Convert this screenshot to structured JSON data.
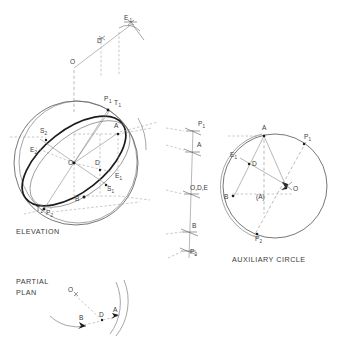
{
  "drawing": {
    "title": "Sphere tangent-plane / auxiliary circle construction",
    "captions": {
      "elevation": "ELEVATION",
      "partial_plan_line1": "PARTIAL",
      "partial_plan_line2": "PLAN",
      "auxiliary_circle": "AUXILIARY CIRCLE"
    }
  },
  "colors": {
    "paper": "#ffffff",
    "outline": "#4a4a4a",
    "heavy": "#1c1c1c",
    "construction": "#7d7d7d",
    "dashed": "#8a8a8a",
    "text": "#3a3a3a"
  },
  "top_view": {
    "points": [
      {
        "id": "top-O",
        "base": "O",
        "sub": "",
        "x": 70,
        "y": 64
      },
      {
        "id": "top-D",
        "base": "D",
        "sub": "",
        "x": 97,
        "y": 43
      },
      {
        "id": "top-E1",
        "base": "E",
        "sub": "1",
        "x": 124,
        "y": 20
      }
    ]
  },
  "elevation": {
    "points": [
      {
        "id": "elev-P1",
        "base": "P",
        "sub": "1",
        "x": 104,
        "y": 101
      },
      {
        "id": "elev-T1",
        "base": "T",
        "sub": "1",
        "x": 114,
        "y": 105
      },
      {
        "id": "elev-A",
        "base": "A",
        "sub": "",
        "x": 114,
        "y": 128
      },
      {
        "id": "elev-S2",
        "base": "S",
        "sub": "2",
        "x": 40,
        "y": 133
      },
      {
        "id": "elev-E2",
        "base": "E",
        "sub": "2",
        "x": 30,
        "y": 152
      },
      {
        "id": "elev-O",
        "base": "O",
        "sub": "",
        "x": 68,
        "y": 165
      },
      {
        "id": "elev-D",
        "base": "D",
        "sub": "",
        "x": 95,
        "y": 165
      },
      {
        "id": "elev-E1",
        "base": "E",
        "sub": "1",
        "x": 115,
        "y": 178
      },
      {
        "id": "elev-S1",
        "base": "S",
        "sub": "1",
        "x": 107,
        "y": 191
      },
      {
        "id": "elev-B",
        "base": "B",
        "sub": "",
        "x": 75,
        "y": 201
      },
      {
        "id": "elev-T2",
        "base": "T",
        "sub": "2",
        "x": 36,
        "y": 211
      },
      {
        "id": "elev-P2",
        "base": "P",
        "sub": "2",
        "x": 46,
        "y": 215
      }
    ]
  },
  "side_line": {
    "points": [
      {
        "id": "side-P1",
        "base": "P",
        "sub": "1",
        "x": 198,
        "y": 126
      },
      {
        "id": "side-A",
        "base": "A",
        "sub": "",
        "x": 197,
        "y": 147
      },
      {
        "id": "side-ODE",
        "base": "O,D,E",
        "sub": "",
        "x": 190,
        "y": 190
      },
      {
        "id": "side-B",
        "base": "B",
        "sub": "",
        "x": 192,
        "y": 228
      },
      {
        "id": "side-P2",
        "base": "P",
        "sub": "2",
        "x": 190,
        "y": 254
      }
    ]
  },
  "auxiliary_circle": {
    "points": [
      {
        "id": "aux-A",
        "base": "A",
        "sub": "",
        "x": 262,
        "y": 128
      },
      {
        "id": "aux-P1",
        "base": "P",
        "sub": "1",
        "x": 304,
        "y": 137
      },
      {
        "id": "aux-E1",
        "base": "E",
        "sub": "1",
        "x": 232,
        "y": 155
      },
      {
        "id": "aux-D",
        "base": "D",
        "sub": "",
        "x": 256,
        "y": 165
      },
      {
        "id": "aux-O",
        "base": "O",
        "sub": "",
        "x": 294,
        "y": 190
      },
      {
        "id": "aux-Abr",
        "base": "(A)",
        "sub": "",
        "x": 261,
        "y": 198
      },
      {
        "id": "aux-B",
        "base": "B",
        "sub": "",
        "x": 225,
        "y": 199
      },
      {
        "id": "aux-P2",
        "base": "P",
        "sub": "2",
        "x": 259,
        "y": 240
      }
    ]
  },
  "partial_plan": {
    "points": [
      {
        "id": "plan-O",
        "base": "O",
        "sub": "",
        "x": 70,
        "y": 292
      },
      {
        "id": "plan-B",
        "base": "B",
        "sub": "",
        "x": 79,
        "y": 320
      },
      {
        "id": "plan-D",
        "base": "D",
        "sub": "",
        "x": 101,
        "y": 314
      },
      {
        "id": "plan-A",
        "base": "A",
        "sub": "",
        "x": 114,
        "y": 310
      }
    ]
  }
}
